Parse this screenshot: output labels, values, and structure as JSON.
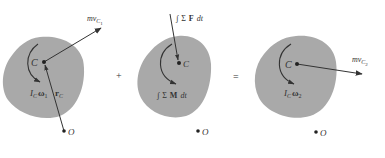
{
  "diagram": {
    "colors": {
      "body_fill": "#a9a9a9",
      "ink": "#333333",
      "background": "#ffffff"
    },
    "operators": {
      "plus": "+",
      "equals": "="
    },
    "panels": [
      {
        "name": "initial-momentum",
        "center_label": "C",
        "origin_label": "O",
        "linear_momentum": {
          "prefix": "mv",
          "subscript": "C",
          "subsub": "1"
        },
        "angular_momentum": {
          "prefix": "I",
          "subscript": "C",
          "omega": "ω",
          "omega_sub": "1"
        },
        "position_vector": {
          "symbol": "r",
          "subscript": "C"
        }
      },
      {
        "name": "impulses",
        "center_label": "C",
        "origin_label": "O",
        "linear_impulse": {
          "integral": "∫",
          "sigma": "Σ",
          "vector": "F",
          "dt": "dt"
        },
        "angular_impulse": {
          "integral": "∫",
          "sigma": "Σ",
          "vector": "M",
          "dt": "dt"
        }
      },
      {
        "name": "final-momentum",
        "center_label": "C",
        "origin_label": "O",
        "linear_momentum": {
          "prefix": "mv",
          "subscript": "C",
          "subsub": "2"
        },
        "angular_momentum": {
          "prefix": "I",
          "subscript": "C",
          "omega": "ω",
          "omega_sub": "2"
        }
      }
    ]
  }
}
